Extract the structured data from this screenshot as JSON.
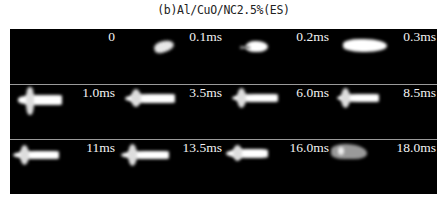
{
  "figure": {
    "caption": "(b)Al/CuO/NC2.5%(ES)",
    "background_color": "#000000",
    "divider_color": "#9a9a9a",
    "rows": [
      {
        "frames": [
          {
            "label": "0"
          },
          {
            "label": "0.1ms"
          },
          {
            "label": "0.2ms"
          },
          {
            "label": "0.3ms"
          }
        ]
      },
      {
        "frames": [
          {
            "label": "1.0ms"
          },
          {
            "label": "3.5ms"
          },
          {
            "label": "6.0ms"
          },
          {
            "label": "8.5ms"
          }
        ]
      },
      {
        "frames": [
          {
            "label": "11ms"
          },
          {
            "label": "13.5ms"
          },
          {
            "label": "16.0ms"
          },
          {
            "label": "18.0ms"
          }
        ]
      }
    ]
  }
}
